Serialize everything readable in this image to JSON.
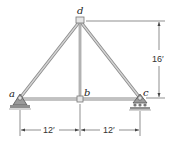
{
  "diagram": {
    "type": "truss",
    "nodes": [
      {
        "id": "a",
        "label": "a",
        "x": 20,
        "y": 98,
        "support": "pin"
      },
      {
        "id": "b",
        "label": "b",
        "x": 80,
        "y": 99,
        "support": "none"
      },
      {
        "id": "c",
        "label": "c",
        "x": 140,
        "y": 98,
        "support": "roller"
      },
      {
        "id": "d",
        "label": "d",
        "x": 80,
        "y": 20,
        "support": "none"
      }
    ],
    "members": [
      [
        "a",
        "d"
      ],
      [
        "d",
        "c"
      ],
      [
        "d",
        "b"
      ],
      [
        "a",
        "b"
      ],
      [
        "b",
        "c"
      ]
    ],
    "dimensions": {
      "height": "16′",
      "left_span": "12′",
      "right_span": "12′"
    },
    "colors": {
      "member": "#b9b9b9",
      "member_edge": "#8a8a8a",
      "support": "#6f6f6f",
      "ground": "#9a9a9a",
      "dim_line": "#444444"
    }
  }
}
